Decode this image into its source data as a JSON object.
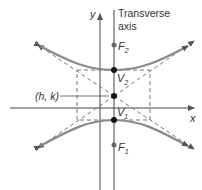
{
  "diagram": {
    "labels": {
      "y_axis": "y",
      "x_axis": "x",
      "transverse_line1": "Transverse",
      "transverse_line2": "axis",
      "center": "(h, k)",
      "F2": "F",
      "F2_sub": "2",
      "V2": "V",
      "V2_sub": "2",
      "V1": "V",
      "V1_sub": "1",
      "F1": "F",
      "F1_sub": "1"
    },
    "points": [
      {
        "name": "F2",
        "x": 114,
        "y": 45
      },
      {
        "name": "V2",
        "x": 114,
        "y": 70
      },
      {
        "name": "center",
        "x": 114,
        "y": 96
      },
      {
        "name": "V1",
        "x": 114,
        "y": 120
      },
      {
        "name": "F1",
        "x": 114,
        "y": 145
      }
    ],
    "colors": {
      "curve": "#8a8a8a",
      "axes": "#444444",
      "dashed": "#777777",
      "point": "#111111",
      "focus": "#666666"
    }
  }
}
